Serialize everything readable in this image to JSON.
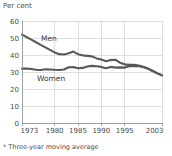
{
  "unit_label": "Per cent",
  "footnote": "* Three-year moving average",
  "labels": {
    "men": "Men",
    "women": "Women"
  },
  "colors": {
    "line": "#585858",
    "grid": "#c9c9c9",
    "axis": "#8a8a8a",
    "text": "#4a4a4a",
    "background": "#ffffff"
  },
  "chart_data": {
    "type": "line",
    "title": "",
    "subtitle": "",
    "xlabel": "",
    "ylabel": "Per cent",
    "ylim": [
      0,
      60
    ],
    "xlim": [
      1973,
      2003
    ],
    "yticks": [
      0,
      10,
      20,
      30,
      40,
      50,
      60
    ],
    "xticks": [
      1973,
      1980,
      1985,
      1990,
      1995,
      2003
    ],
    "ytick_labels": [
      "0",
      "10",
      "20",
      "30",
      "40",
      "50",
      "60"
    ],
    "xtick_labels": [
      "1973",
      "1980",
      "1985",
      "1990",
      "1995",
      "2003"
    ],
    "grid": true,
    "legend": "inline-labels",
    "annotations": [
      "Men",
      "Women"
    ],
    "x": [
      1973,
      1974,
      1975,
      1976,
      1977,
      1978,
      1979,
      1980,
      1981,
      1982,
      1983,
      1984,
      1985,
      1986,
      1987,
      1988,
      1989,
      1990,
      1991,
      1992,
      1993,
      1994,
      1995,
      1996,
      1997,
      1998,
      1999,
      2000,
      2001,
      2002,
      2003
    ],
    "series": [
      {
        "name": "Men",
        "values": [
          52.0,
          50.5,
          49.0,
          47.5,
          46.0,
          44.5,
          43.0,
          41.5,
          40.5,
          40.3,
          41.0,
          42.0,
          40.5,
          39.8,
          39.5,
          39.2,
          38.0,
          37.3,
          36.3,
          37.0,
          37.2,
          35.5,
          34.5,
          34.2,
          34.3,
          33.8,
          33.0,
          32.0,
          30.6,
          29.2,
          28.0
        ]
      },
      {
        "name": "Women",
        "values": [
          32.0,
          32.0,
          31.8,
          31.3,
          31.2,
          31.6,
          31.5,
          31.3,
          31.2,
          31.5,
          32.8,
          32.9,
          32.2,
          32.4,
          33.2,
          33.6,
          33.4,
          33.0,
          32.2,
          33.0,
          32.6,
          32.7,
          32.6,
          33.4,
          33.6,
          33.4,
          33.0,
          32.0,
          30.6,
          29.2,
          28.0
        ]
      }
    ]
  }
}
